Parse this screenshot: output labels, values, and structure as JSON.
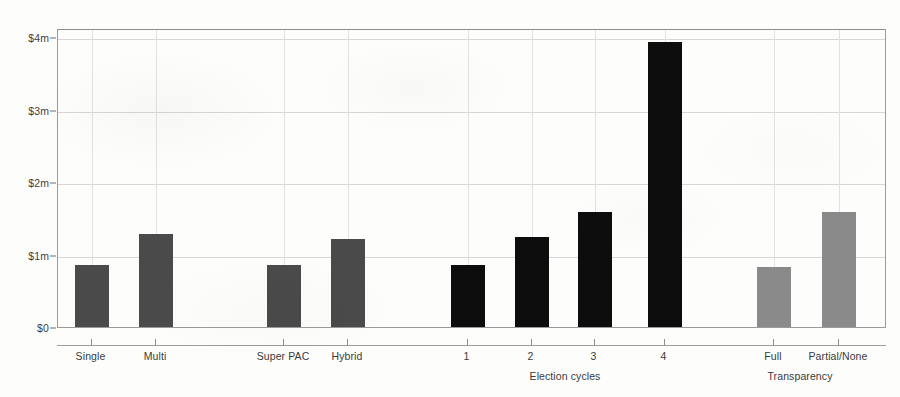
{
  "chart_data": {
    "type": "bar",
    "title": "",
    "subtitle": "",
    "xlabel": "",
    "ylabel": "",
    "ylim": [
      0,
      4.35
    ],
    "y_unit": "millions of dollars",
    "grid": true,
    "legend": false,
    "y_ticks": [
      {
        "value": 0,
        "label": "$0"
      },
      {
        "value": 1,
        "label": "$1m"
      },
      {
        "value": 2,
        "label": "$2m"
      },
      {
        "value": 3,
        "label": "$3m"
      },
      {
        "value": 4,
        "label": "$4m"
      }
    ],
    "categories": [
      "Single",
      "Multi",
      "Super PAC",
      "Hybrid",
      "1",
      "2",
      "3",
      "4",
      "Full",
      "Partial/None"
    ],
    "values": [
      0.85,
      1.28,
      0.85,
      1.21,
      0.85,
      1.24,
      1.59,
      3.93,
      0.83,
      1.59
    ],
    "groups": [
      {
        "name": "",
        "label": "",
        "color": "#4a4a4a",
        "bars": [
          {
            "label": "Single",
            "value": 0.85,
            "x_center": 90.5,
            "width": 34
          },
          {
            "label": "Multi",
            "value": 1.28,
            "x_center": 155.0,
            "width": 34
          }
        ]
      },
      {
        "name": "",
        "label": "",
        "color": "#4a4a4a",
        "bars": [
          {
            "label": "Super PAC",
            "value": 0.85,
            "x_center": 283.0,
            "width": 34
          },
          {
            "label": "Hybrid",
            "value": 1.21,
            "x_center": 347.0,
            "width": 34
          }
        ]
      },
      {
        "name": "election-cycles",
        "label": "Election cycles",
        "color": "#0d0d0d",
        "label_x": 565,
        "bars": [
          {
            "label": "1",
            "value": 0.85,
            "x_center": 466.5,
            "width": 34
          },
          {
            "label": "2",
            "value": 1.24,
            "x_center": 530.5,
            "width": 34
          },
          {
            "label": "3",
            "value": 1.59,
            "x_center": 593.5,
            "width": 34
          },
          {
            "label": "4",
            "value": 3.93,
            "x_center": 663.5,
            "width": 34
          }
        ]
      },
      {
        "name": "transparency",
        "label": "Transparency",
        "color": "#8a8a8a",
        "label_x": 800,
        "bars": [
          {
            "label": "Full",
            "value": 0.83,
            "x_center": 773.0,
            "width": 34
          },
          {
            "label": "Partial/None",
            "value": 1.59,
            "x_center": 838.0,
            "width": 34
          }
        ]
      }
    ],
    "group_labels": [
      "Election cycles",
      "Transparency"
    ],
    "colors": {
      "group_organization_type": "#4a4a4a",
      "group_committee_type": "#4a4a4a",
      "group_election_cycles": "#0d0d0d",
      "group_transparency": "#8a8a8a",
      "gridline": "#d7d7d7",
      "axis": "#9a9a9a",
      "text": "#3a3a3a",
      "background": "#fdfdfc"
    }
  }
}
